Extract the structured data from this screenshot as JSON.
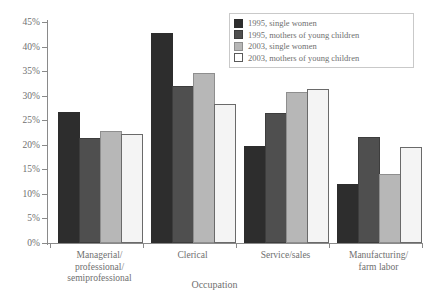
{
  "chart_data": {
    "type": "bar",
    "title": "",
    "xlabel": "Occupation",
    "ylabel": "",
    "ylim": [
      0,
      45
    ],
    "ytick_labels": [
      "0%",
      "5%",
      "10%",
      "15%",
      "20%",
      "25%",
      "30%",
      "35%",
      "40%",
      "45%"
    ],
    "ytick_values": [
      0,
      5,
      10,
      15,
      20,
      25,
      30,
      35,
      40,
      45
    ],
    "grid": false,
    "legend_position": "top-right",
    "categories": [
      "Managerial/\nprofessional/\nsemiprofessional",
      "Clerical",
      "Service/sales",
      "Manufacturing/\nfarm labor"
    ],
    "category_lines": [
      [
        "Managerial/",
        "professional/",
        "semiprofessional"
      ],
      [
        "Clerical"
      ],
      [
        "Service/sales"
      ],
      [
        "Manufacturing/",
        "farm labor"
      ]
    ],
    "series": [
      {
        "name": "1995, single women",
        "color": "#2d2d2d",
        "values": [
          26.3,
          42.4,
          19.3,
          11.7
        ]
      },
      {
        "name": "1995, mothers of young children",
        "color": "#4f4f4f",
        "values": [
          21.0,
          31.6,
          26.1,
          21.1
        ]
      },
      {
        "name": "2003, single women",
        "color": "#b7b7b7",
        "values": [
          22.3,
          34.2,
          30.3,
          13.7
        ]
      },
      {
        "name": "2003, mothers of young children",
        "color": "#f4f4f4",
        "values": [
          21.8,
          27.8,
          31.0,
          19.2
        ]
      }
    ]
  }
}
